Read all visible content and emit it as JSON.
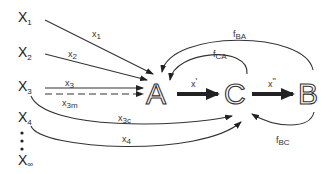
{
  "diagram": {
    "type": "flow-diagram",
    "sources": [
      {
        "id": "X1",
        "base": "X",
        "sub": "1"
      },
      {
        "id": "X2",
        "base": "X",
        "sub": "2"
      },
      {
        "id": "X3",
        "base": "X",
        "sub": "3"
      },
      {
        "id": "X4",
        "base": "X",
        "sub": "4"
      },
      {
        "id": "Xinf",
        "base": "X",
        "sub": "∞"
      }
    ],
    "ellipsis": "⋮",
    "nodes": [
      {
        "id": "A",
        "label": "A"
      },
      {
        "id": "C",
        "label": "C"
      },
      {
        "id": "B",
        "label": "B"
      }
    ],
    "edges": [
      {
        "from": "X1",
        "to": "A",
        "label_base": "x",
        "label_sub": "1",
        "style": "solid"
      },
      {
        "from": "X2",
        "to": "A",
        "label_base": "x",
        "label_sub": "2",
        "style": "solid"
      },
      {
        "from": "X3",
        "to": "A",
        "label_base": "x",
        "label_sub": "3",
        "style": "solid"
      },
      {
        "from": "X3",
        "to": "A",
        "label_base": "x",
        "label_sub": "3m",
        "style": "dashed"
      },
      {
        "from": "X3",
        "to": "C",
        "label_base": "x",
        "label_sub": "3c",
        "style": "solid-curved"
      },
      {
        "from": "X4",
        "to": "C",
        "label_base": "x",
        "label_sub": "4",
        "style": "solid-curved"
      },
      {
        "from": "A",
        "to": "C",
        "label_base": "x",
        "label_sub": "'",
        "style": "thick"
      },
      {
        "from": "C",
        "to": "B",
        "label_base": "x",
        "label_sub": "''",
        "style": "thick"
      },
      {
        "from": "C",
        "to": "A",
        "label_base": "f",
        "label_sub": "CA",
        "style": "feedback"
      },
      {
        "from": "B",
        "to": "A",
        "label_base": "f",
        "label_sub": "BA",
        "style": "feedback"
      },
      {
        "from": "B",
        "to": "C",
        "label_base": "f",
        "label_sub": "BC",
        "style": "feedback"
      }
    ]
  }
}
